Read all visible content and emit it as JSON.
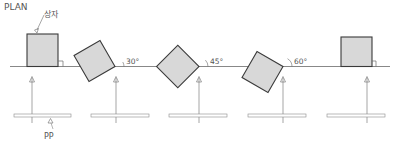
{
  "title": "PLAN",
  "box_label": "상자",
  "picture_plane_label": "PP",
  "colors": {
    "line": "#6a6a6a",
    "box_stroke": "#3a3a3a",
    "box_fill": "#d8d8d8",
    "text": "#555555"
  },
  "ground_line": {
    "y": 66.5,
    "x1": 10,
    "x2": 390
  },
  "boxes": [
    {
      "label": "0°",
      "angle": 0,
      "cx": 42,
      "note": "right-angle mark"
    },
    {
      "label": "30°",
      "angle": 30,
      "cx": 116
    },
    {
      "label": "45°",
      "angle": 45,
      "cx": 199
    },
    {
      "label": "60°",
      "angle": 60,
      "cx": 283
    },
    {
      "label": "90°",
      "angle": 90,
      "cx": 356,
      "note": "right-angle mark"
    }
  ],
  "angle_labels": [
    "30°",
    "45°",
    "60°"
  ],
  "sight_lines": [
    32,
    116,
    199,
    283,
    367
  ],
  "picture_planes": [
    {
      "x1": 14,
      "x2": 71
    },
    {
      "x1": 91,
      "x2": 149
    },
    {
      "x1": 169,
      "x2": 227
    },
    {
      "x1": 248,
      "x2": 306
    },
    {
      "x1": 327,
      "x2": 385
    }
  ]
}
